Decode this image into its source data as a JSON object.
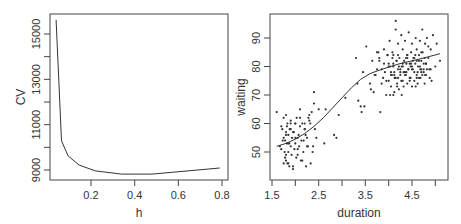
{
  "chart_data": [
    {
      "type": "line",
      "title": "",
      "xlabel": "h",
      "ylabel": "CV",
      "xlim": [
        0.02,
        0.82
      ],
      "ylim": [
        8600,
        15900
      ],
      "xticks": [
        0.2,
        0.4,
        0.6,
        0.8
      ],
      "xtick_labels": [
        "0.2",
        "0.4",
        "0.6",
        "0.8"
      ],
      "yticks": [
        9000,
        10000,
        11000,
        12000,
        13000,
        14000,
        15000
      ],
      "ytick_labels": [
        "9000",
        "",
        "11000",
        "",
        "13000",
        "",
        "15000"
      ],
      "grid": false,
      "x": [
        0.04,
        0.065,
        0.095,
        0.145,
        0.22,
        0.34,
        0.48,
        0.79
      ],
      "y": [
        15620,
        10290,
        9620,
        9220,
        8960,
        8820,
        8820,
        9090
      ]
    },
    {
      "type": "scatter",
      "title": "",
      "xlabel": "duration",
      "ylabel": "waiting",
      "xlim": [
        1.45,
        5.2
      ],
      "ylim": [
        41,
        97.5
      ],
      "xticks": [
        1.5,
        2.0,
        2.5,
        3.0,
        3.5,
        4.0,
        4.5,
        5.0
      ],
      "xtick_labels": [
        "1.5",
        "",
        "2.5",
        "",
        "3.5",
        "",
        "4.5",
        ""
      ],
      "yticks": [
        50,
        60,
        70,
        80,
        90
      ],
      "ytick_labels": [
        "50",
        "60",
        "70",
        "80",
        "90"
      ],
      "grid": false,
      "smooth_line": {
        "x": [
          1.6,
          1.8,
          2.0,
          2.2,
          2.4,
          2.6,
          2.8,
          3.0,
          3.2,
          3.4,
          3.6,
          3.8,
          4.0,
          4.2,
          4.4,
          4.6,
          4.8,
          5.1
        ],
        "y": [
          52,
          53,
          54.5,
          56.5,
          59,
          62,
          65.5,
          69,
          72.5,
          75.5,
          77.5,
          78.7,
          79.8,
          80.8,
          81.6,
          82.4,
          83.2,
          84.5
        ]
      },
      "points": {
        "x": [
          1.6,
          1.67,
          1.7,
          1.72,
          1.75,
          1.75,
          1.78,
          1.8,
          1.8,
          1.8,
          1.82,
          1.83,
          1.83,
          1.85,
          1.85,
          1.87,
          1.88,
          1.9,
          1.9,
          1.92,
          1.93,
          1.95,
          1.97,
          2.0,
          2.0,
          2.02,
          2.03,
          2.05,
          2.07,
          2.1,
          2.1,
          2.13,
          2.15,
          2.17,
          2.2,
          2.2,
          2.23,
          2.25,
          2.27,
          2.3,
          2.33,
          2.35,
          2.37,
          2.4,
          2.42,
          2.45,
          1.73,
          1.77,
          1.78,
          1.8,
          1.82,
          1.85,
          1.87,
          1.9,
          1.95,
          1.98,
          2.0,
          2.05,
          2.08,
          2.12,
          2.15,
          2.18,
          2.22,
          2.28,
          2.32,
          2.38,
          1.7,
          1.75,
          1.8,
          1.85,
          1.9,
          1.95,
          2.0,
          2.05,
          2.1,
          2.2,
          2.25,
          2.3,
          2.4,
          2.5,
          2.62,
          2.65,
          2.83,
          2.88,
          2.93,
          3.07,
          3.3,
          3.33,
          3.35,
          3.4,
          3.42,
          3.45,
          3.48,
          3.52,
          3.6,
          3.62,
          3.65,
          3.68,
          3.72,
          3.75,
          3.78,
          3.8,
          3.82,
          3.85,
          3.88,
          3.9,
          3.92,
          3.95,
          3.97,
          4.0,
          4.0,
          4.02,
          4.03,
          4.05,
          4.07,
          4.08,
          4.1,
          4.1,
          4.12,
          4.13,
          4.15,
          4.17,
          4.18,
          4.2,
          4.2,
          4.22,
          4.23,
          4.25,
          4.27,
          4.28,
          4.3,
          4.3,
          4.32,
          4.33,
          4.35,
          4.37,
          4.38,
          4.4,
          4.4,
          4.42,
          4.43,
          4.45,
          4.47,
          4.48,
          4.5,
          4.5,
          4.52,
          4.53,
          4.55,
          4.57,
          4.58,
          4.6,
          4.6,
          4.62,
          4.63,
          4.65,
          4.67,
          4.68,
          4.7,
          4.7,
          4.72,
          4.73,
          4.75,
          4.77,
          4.78,
          4.8,
          4.8,
          4.82,
          4.85,
          4.87,
          4.9,
          4.92,
          4.95,
          5.0,
          5.03,
          5.1,
          4.05,
          4.1,
          4.15,
          4.2,
          4.25,
          4.3,
          4.35,
          4.4,
          4.45,
          4.5,
          4.55,
          4.6,
          4.65,
          4.7,
          4.75,
          4.8,
          4.85,
          4.9,
          3.98,
          4.03,
          4.08,
          4.12,
          4.17,
          4.22,
          4.27,
          4.32,
          4.37,
          4.42,
          4.47,
          4.52,
          4.57,
          4.62,
          4.67,
          4.72,
          4.77,
          4.82,
          3.9,
          3.95,
          4.0,
          4.05,
          4.1,
          4.15,
          4.2,
          4.25,
          4.3,
          4.35,
          4.4,
          4.45,
          4.5,
          4.55,
          4.6,
          4.65,
          4.7,
          4.75,
          3.7,
          3.75,
          3.8,
          3.85,
          4.12,
          4.18,
          4.28,
          4.38,
          4.48,
          4.58,
          4.68,
          4.78,
          4.88
        ],
        "y": [
          64,
          52,
          59,
          58,
          62,
          55,
          54,
          63,
          57,
          47,
          53,
          60,
          46,
          56,
          50,
          45,
          58,
          52,
          61,
          49,
          55,
          44,
          57,
          60,
          53,
          48,
          62,
          51,
          56,
          59,
          65,
          54,
          47,
          50,
          58,
          60,
          45,
          55,
          52,
          63,
          46,
          64,
          50,
          71,
          58,
          55,
          54,
          50,
          48,
          56,
          59,
          46,
          53,
          60,
          57,
          51,
          55,
          49,
          52,
          47,
          60,
          54,
          56,
          62,
          60,
          52,
          51,
          46,
          49,
          53,
          58,
          45,
          60,
          55,
          62,
          58,
          52,
          61,
          67,
          65,
          53,
          65,
          56,
          55,
          63,
          69,
          83,
          74,
          68,
          66,
          64,
          78,
          66,
          87,
          74,
          72,
          82,
          71,
          77,
          79,
          85,
          83,
          64,
          79,
          76,
          81,
          78,
          70,
          84,
          75,
          80,
          89,
          70,
          73,
          77,
          85,
          70,
          81,
          78,
          76,
          93,
          82,
          74,
          88,
          79,
          72,
          83,
          78,
          91,
          80,
          75,
          86,
          73,
          82,
          89,
          77,
          81,
          74,
          84,
          79,
          92,
          76,
          80,
          85,
          73,
          88,
          79,
          83,
          75,
          81,
          90,
          77,
          86,
          74,
          80,
          84,
          89,
          76,
          82,
          78,
          93,
          85,
          79,
          74,
          88,
          81,
          77,
          90,
          83,
          79,
          86,
          75,
          91,
          80,
          88,
          82,
          77,
          84,
          96,
          76,
          77,
          80,
          78,
          84,
          81,
          79,
          83,
          76,
          82,
          85,
          78,
          81,
          87,
          79,
          84,
          80,
          83,
          77,
          82,
          80,
          75,
          78,
          83,
          79,
          76,
          82,
          84,
          78,
          80,
          77,
          83,
          79,
          86,
          75,
          81,
          78,
          80,
          76,
          84,
          79,
          81,
          77,
          83,
          75,
          80,
          78,
          82,
          76,
          79,
          81,
          77,
          85,
          82,
          74,
          71,
          73,
          70,
          78,
          81,
          73,
          79,
          77,
          76,
          80,
          78,
          84
        ]
      }
    }
  ]
}
